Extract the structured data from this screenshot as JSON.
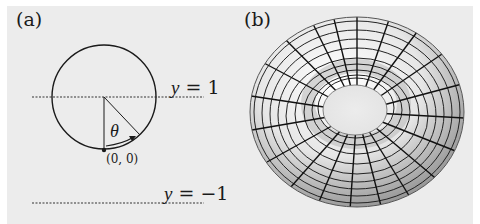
{
  "panels": {
    "a": {
      "label": "(a)",
      "line_top_label_var": "y",
      "line_top_label_eq": "= 1",
      "line_bottom_label_var": "y",
      "line_bottom_label_eq": "= −1",
      "angle_label": "θ",
      "point_label": "(0, 0)"
    },
    "b": {
      "label": "(b)",
      "description": "torus with parametric grid lines"
    }
  },
  "colors": {
    "background": "#ececec",
    "stroke": "#1a1a1a",
    "torus_light": "#ffffff",
    "torus_dark": "#8a8a8a"
  }
}
